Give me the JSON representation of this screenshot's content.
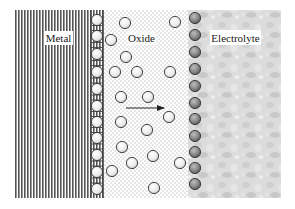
{
  "figure": {
    "regions": {
      "metal": {
        "label": "Metal",
        "x": 15,
        "width": 89
      },
      "oxide": {
        "label": "Oxide",
        "x": 104,
        "width": 84
      },
      "electrolyte": {
        "label": "Electrolyte",
        "x": 188,
        "width": 93
      }
    },
    "labels": {
      "metal": "Metal",
      "oxide": "Oxide",
      "electrolyte": "Electrolyte"
    },
    "arrow": {
      "x1": 126,
      "y1": 108,
      "x2": 164,
      "y2": 108,
      "direction": "right"
    },
    "colors": {
      "metal_lines": "#555555",
      "oxide_dots": "#9a9a9a",
      "electrolyte_bg": "#d9d9d9",
      "metal_interface_circle": "#f2f2f2",
      "electrolyte_interface_circle": "#8c8c8c",
      "free_circle": "#f4f4f4",
      "circle_stroke": "#333333"
    },
    "metal_interface_circles": [
      {
        "x": 97,
        "y": 20
      },
      {
        "x": 97,
        "y": 36
      },
      {
        "x": 97,
        "y": 54
      },
      {
        "x": 97,
        "y": 72
      },
      {
        "x": 97,
        "y": 89
      },
      {
        "x": 97,
        "y": 106
      },
      {
        "x": 97,
        "y": 122
      },
      {
        "x": 97,
        "y": 138
      },
      {
        "x": 97,
        "y": 155
      },
      {
        "x": 97,
        "y": 172
      },
      {
        "x": 97,
        "y": 189
      }
    ],
    "electrolyte_interface_circles": [
      {
        "x": 195,
        "y": 18
      },
      {
        "x": 195,
        "y": 35
      },
      {
        "x": 195,
        "y": 52
      },
      {
        "x": 195,
        "y": 69
      },
      {
        "x": 195,
        "y": 86
      },
      {
        "x": 195,
        "y": 103
      },
      {
        "x": 195,
        "y": 119
      },
      {
        "x": 195,
        "y": 136
      },
      {
        "x": 195,
        "y": 152
      },
      {
        "x": 195,
        "y": 168
      },
      {
        "x": 195,
        "y": 184
      }
    ],
    "oxide_free_circles": [
      {
        "x": 125,
        "y": 23
      },
      {
        "x": 175,
        "y": 22
      },
      {
        "x": 111,
        "y": 40
      },
      {
        "x": 126,
        "y": 57
      },
      {
        "x": 115,
        "y": 72
      },
      {
        "x": 137,
        "y": 72
      },
      {
        "x": 170,
        "y": 72
      },
      {
        "x": 121,
        "y": 97
      },
      {
        "x": 148,
        "y": 97
      },
      {
        "x": 169,
        "y": 117
      },
      {
        "x": 121,
        "y": 122
      },
      {
        "x": 147,
        "y": 130
      },
      {
        "x": 122,
        "y": 147
      },
      {
        "x": 153,
        "y": 156
      },
      {
        "x": 132,
        "y": 163
      },
      {
        "x": 180,
        "y": 163
      },
      {
        "x": 112,
        "y": 171
      },
      {
        "x": 154,
        "y": 188
      }
    ]
  }
}
